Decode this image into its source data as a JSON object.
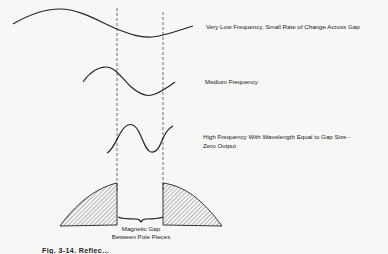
{
  "diagram": {
    "waveforms": [
      {
        "id": "very-low",
        "label": "Very Low Frequency, Small Rate of Change Across Gap"
      },
      {
        "id": "medium",
        "label": "Medium Frequency"
      },
      {
        "id": "high",
        "label": "High Frequency With  Wavelength Equal to Gap Size -",
        "label2": "Zero Output"
      }
    ],
    "gap_label_line1": "Magnetic Gap",
    "gap_label_line2": "Between Pole Pieces",
    "caption": "Fig. 3-14. Reflec..."
  }
}
